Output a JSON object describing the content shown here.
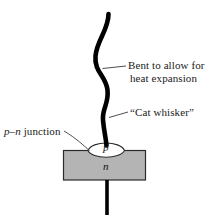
{
  "figure": {
    "name": "point-contact-diode-diagram",
    "background_color": "#ffffff",
    "line_color": "#000000",
    "text_color": "#1a1a1a",
    "semiconductor_fill": "#b4b4b4",
    "semiconductor_stroke": "#2b2b2b",
    "junction_fill": "#ffffff"
  },
  "labels": {
    "bent_line1": "Bent to allow for",
    "bent_line2": "heat expansion",
    "cat_whisker": "“Cat whisker”",
    "pn_junction_p": "p",
    "pn_junction_dash": "–",
    "pn_junction_n": "n",
    "pn_junction_word": " junction"
  },
  "regions": {
    "p_letter": "p",
    "n_letter": "n"
  },
  "icons": {
    "whisker_wire": "wavy-wire-icon",
    "semiconductor_block": "semiconductor-block-icon",
    "junction_lens": "junction-lens-icon",
    "bottom_lead": "bottom-lead-icon",
    "leader_bent": "leader-line-icon",
    "leader_catwhisker": "leader-line-icon",
    "leader_pn": "leader-line-icon"
  }
}
